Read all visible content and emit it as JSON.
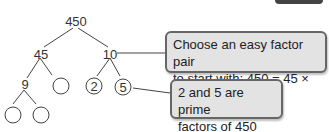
{
  "tree": {
    "root": "450",
    "level1": [
      "45",
      "10"
    ],
    "level2": [
      "9",
      "",
      "2",
      "5"
    ],
    "level3": [
      "",
      ""
    ]
  },
  "callouts": [
    {
      "lines": [
        "Choose an easy factor pair",
        "to start with: 450 = 45 × 10"
      ]
    },
    {
      "lines": [
        "2 and 5 are prime",
        "factors of 450"
      ]
    }
  ],
  "colors": {
    "callout_bg": "#e3e3e3",
    "callout_border": "#666666",
    "line": "#444444"
  }
}
